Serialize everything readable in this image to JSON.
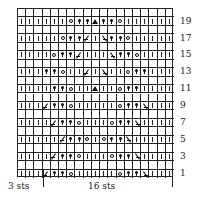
{
  "chart_data": {
    "type": "table",
    "columns": 19,
    "rows_total": 20,
    "legend": {
      "k": "knit (vertical bar)",
      "yo": "yarn over (open circle)",
      "bead": "bead / nupp (filled dot with stem)",
      "k2tog": "right-leaning decrease (/)",
      "ssk": "left-leaning decrease (\\)",
      "cdd": "centered double decrease (triangle)",
      "blank": "no symbol (wrong-side row)"
    },
    "rows": [
      {
        "row": 20,
        "cells": [
          "blank",
          "blank",
          "blank",
          "blank",
          "blank",
          "blank",
          "blank",
          "blank",
          "blank",
          "blank",
          "blank",
          "blank",
          "blank",
          "blank",
          "blank",
          "blank",
          "blank",
          "blank",
          "blank"
        ]
      },
      {
        "row": 19,
        "label": "19",
        "cells": [
          "k",
          "k",
          "k",
          "k",
          "k",
          "k",
          "yo",
          "bead",
          "bead",
          "cdd",
          "bead",
          "bead",
          "yo",
          "k",
          "k",
          "k",
          "k",
          "k",
          "k"
        ]
      },
      {
        "row": 18,
        "cells": [
          "blank",
          "blank",
          "blank",
          "blank",
          "blank",
          "blank",
          "blank",
          "blank",
          "blank",
          "blank",
          "blank",
          "blank",
          "blank",
          "blank",
          "blank",
          "blank",
          "blank",
          "blank",
          "blank"
        ]
      },
      {
        "row": 17,
        "label": "17",
        "cells": [
          "k",
          "k",
          "k",
          "k",
          "k",
          "yo",
          "bead",
          "bead",
          "k2tog",
          "k",
          "ssk",
          "bead",
          "bead",
          "yo",
          "k",
          "k",
          "k",
          "k",
          "k"
        ]
      },
      {
        "row": 16,
        "cells": [
          "blank",
          "blank",
          "blank",
          "blank",
          "blank",
          "blank",
          "blank",
          "blank",
          "blank",
          "blank",
          "blank",
          "blank",
          "blank",
          "blank",
          "blank",
          "blank",
          "blank",
          "blank",
          "blank"
        ]
      },
      {
        "row": 15,
        "label": "15",
        "cells": [
          "k",
          "k",
          "k",
          "k",
          "yo",
          "bead",
          "bead",
          "k2tog",
          "k",
          "k",
          "k",
          "ssk",
          "bead",
          "bead",
          "yo",
          "k",
          "k",
          "k",
          "k"
        ]
      },
      {
        "row": 14,
        "cells": [
          "blank",
          "blank",
          "blank",
          "blank",
          "blank",
          "blank",
          "blank",
          "blank",
          "blank",
          "blank",
          "blank",
          "blank",
          "blank",
          "blank",
          "blank",
          "blank",
          "blank",
          "blank",
          "blank"
        ]
      },
      {
        "row": 13,
        "label": "13",
        "cells": [
          "k",
          "k",
          "k",
          "bead",
          "bead",
          "yo",
          "k",
          "k",
          "k2tog",
          "k",
          "ssk",
          "k",
          "k",
          "yo",
          "bead",
          "bead",
          "k",
          "k",
          "k"
        ]
      },
      {
        "row": 12,
        "cells": [
          "blank",
          "blank",
          "blank",
          "blank",
          "blank",
          "blank",
          "blank",
          "blank",
          "blank",
          "blank",
          "blank",
          "blank",
          "blank",
          "blank",
          "blank",
          "blank",
          "blank",
          "blank",
          "blank"
        ]
      },
      {
        "row": 11,
        "label": "11",
        "cells": [
          "k",
          "k",
          "k",
          "k",
          "bead",
          "bead",
          "yo",
          "k",
          "k",
          "cdd",
          "k",
          "k",
          "yo",
          "bead",
          "bead",
          "k",
          "k",
          "k",
          "k"
        ]
      },
      {
        "row": 10,
        "cells": [
          "blank",
          "blank",
          "blank",
          "blank",
          "blank",
          "blank",
          "blank",
          "blank",
          "blank",
          "blank",
          "blank",
          "blank",
          "blank",
          "blank",
          "blank",
          "blank",
          "blank",
          "blank",
          "blank"
        ]
      },
      {
        "row": 9,
        "label": "9",
        "cells": [
          "k",
          "k",
          "k",
          "k2tog",
          "bead",
          "bead",
          "yo",
          "k",
          "k",
          "k",
          "k",
          "k",
          "yo",
          "bead",
          "bead",
          "ssk",
          "k",
          "k",
          "k"
        ]
      },
      {
        "row": 8,
        "cells": [
          "blank",
          "blank",
          "blank",
          "blank",
          "blank",
          "blank",
          "blank",
          "blank",
          "blank",
          "blank",
          "blank",
          "blank",
          "blank",
          "blank",
          "blank",
          "blank",
          "blank",
          "blank",
          "blank"
        ]
      },
      {
        "row": 7,
        "label": "7",
        "cells": [
          "k",
          "k",
          "k",
          "k",
          "k2tog",
          "bead",
          "bead",
          "yo",
          "k",
          "k",
          "k",
          "yo",
          "bead",
          "bead",
          "ssk",
          "k",
          "k",
          "k",
          "k"
        ]
      },
      {
        "row": 6,
        "cells": [
          "blank",
          "blank",
          "blank",
          "blank",
          "blank",
          "blank",
          "blank",
          "blank",
          "blank",
          "blank",
          "blank",
          "blank",
          "blank",
          "blank",
          "blank",
          "blank",
          "blank",
          "blank",
          "blank"
        ]
      },
      {
        "row": 5,
        "label": "5",
        "cells": [
          "k",
          "k",
          "k",
          "k",
          "k",
          "k2tog",
          "bead",
          "bead",
          "yo",
          "k",
          "yo",
          "bead",
          "bead",
          "ssk",
          "k",
          "k",
          "k",
          "k",
          "k"
        ]
      },
      {
        "row": 4,
        "cells": [
          "blank",
          "blank",
          "blank",
          "blank",
          "blank",
          "blank",
          "blank",
          "blank",
          "blank",
          "blank",
          "blank",
          "blank",
          "blank",
          "blank",
          "blank",
          "blank",
          "blank",
          "blank",
          "blank"
        ]
      },
      {
        "row": 3,
        "label": "3",
        "cells": [
          "k",
          "k",
          "k",
          "k",
          "k2tog",
          "bead",
          "bead",
          "yo",
          "k",
          "k",
          "k",
          "yo",
          "bead",
          "bead",
          "ssk",
          "k",
          "k",
          "k",
          "k"
        ]
      },
      {
        "row": 2,
        "cells": [
          "blank",
          "blank",
          "blank",
          "blank",
          "blank",
          "blank",
          "blank",
          "blank",
          "blank",
          "blank",
          "blank",
          "blank",
          "blank",
          "blank",
          "blank",
          "blank",
          "blank",
          "blank",
          "blank"
        ]
      },
      {
        "row": 1,
        "label": "1",
        "cells": [
          "k",
          "k",
          "k",
          "k2tog",
          "bead",
          "bead",
          "yo",
          "k",
          "k",
          "k",
          "k",
          "k",
          "yo",
          "bead",
          "bead",
          "ssk",
          "k",
          "k",
          "k"
        ]
      }
    ],
    "repeat_labels": {
      "edge": "3 sts",
      "repeat": "16 sts"
    }
  },
  "labels": {
    "edge": "3 sts",
    "repeat": "16 sts"
  }
}
